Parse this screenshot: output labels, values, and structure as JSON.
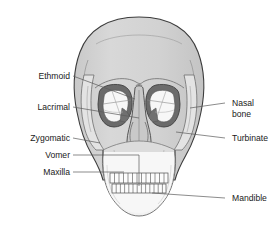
{
  "diagram": {
    "background_color": "#ffffff",
    "watermark_text": "anatomy",
    "label_color": "#1a1a1a",
    "leader_color": "#5a5a5a",
    "bone_fill": "#d2d2d2",
    "bone_fill_light": "#e6e6e6",
    "bone_fill_pale": "#f2f2f2",
    "orbit_rim_color": "#6b6b6b",
    "orbit_inner_color": "#f7f7f7",
    "outline_color": "#3c3c3c",
    "tooth_fill": "#fcfcfc"
  },
  "labels": {
    "left": [
      {
        "id": "ethmoid",
        "text": "Ethmoid",
        "x": 70,
        "y": 79
      },
      {
        "id": "lacrimal",
        "text": "Lacrimal",
        "x": 70,
        "y": 110
      },
      {
        "id": "zygomatic",
        "text": "Zygomatic",
        "x": 70,
        "y": 141
      },
      {
        "id": "vomer",
        "text": "Vomer",
        "x": 70,
        "y": 158
      },
      {
        "id": "maxilla",
        "text": "Maxilla",
        "x": 70,
        "y": 175
      }
    ],
    "right": [
      {
        "id": "nasal-bone",
        "text_line1": "Nasal",
        "text_line2": "bone",
        "x": 232,
        "y": 106
      },
      {
        "id": "turbinate",
        "text": "Turbinate",
        "x": 232,
        "y": 141
      },
      {
        "id": "mandible",
        "text": "Mandible",
        "x": 232,
        "y": 201
      }
    ]
  },
  "structures": [
    {
      "id": "cranium",
      "name": "cranium"
    },
    {
      "id": "orbit-left",
      "name": "left orbit"
    },
    {
      "id": "orbit-right",
      "name": "right orbit"
    },
    {
      "id": "nasal-aperture",
      "name": "nasal aperture"
    },
    {
      "id": "maxilla-body",
      "name": "maxilla"
    },
    {
      "id": "mandible-body",
      "name": "mandible"
    },
    {
      "id": "teeth-upper",
      "name": "upper teeth",
      "count": 13
    },
    {
      "id": "teeth-lower",
      "name": "lower teeth",
      "count": 13
    }
  ]
}
